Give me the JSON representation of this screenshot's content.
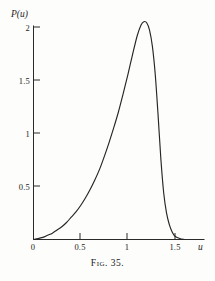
{
  "figure": {
    "caption_prefix": "Fig.",
    "caption_number": "35.",
    "caption_full": "Fig. 35."
  },
  "chart_data": {
    "type": "line",
    "title": "",
    "subtitle": "",
    "xlabel": "u",
    "ylabel": "P(u)",
    "xlim": [
      0,
      1.62
    ],
    "ylim": [
      0,
      2.18
    ],
    "xticks": [
      0,
      0.5,
      1,
      1.5
    ],
    "xticklabels": [
      "0",
      "0.5",
      "1",
      "1.5"
    ],
    "yticks": [
      0,
      0.5,
      1,
      1.5,
      2
    ],
    "yticklabels": [
      "0",
      "0.5",
      "1",
      "1.5",
      "2"
    ],
    "grid": false,
    "legend": null,
    "annotations": [],
    "series": [
      {
        "name": "P(u)",
        "color": "#262626",
        "x": [
          0.0,
          0.05,
          0.1,
          0.15,
          0.2,
          0.25,
          0.3,
          0.35,
          0.4,
          0.45,
          0.5,
          0.55,
          0.6,
          0.65,
          0.7,
          0.75,
          0.8,
          0.85,
          0.9,
          0.95,
          1.0,
          1.05,
          1.1,
          1.14,
          1.17,
          1.2,
          1.23,
          1.26,
          1.29,
          1.32,
          1.35,
          1.38,
          1.41,
          1.44,
          1.47,
          1.5,
          1.55,
          1.6
        ],
        "y": [
          0.0,
          0.01,
          0.02,
          0.04,
          0.06,
          0.09,
          0.12,
          0.16,
          0.21,
          0.26,
          0.32,
          0.39,
          0.47,
          0.56,
          0.66,
          0.78,
          0.91,
          1.05,
          1.2,
          1.37,
          1.55,
          1.74,
          1.92,
          2.02,
          2.05,
          2.04,
          1.97,
          1.82,
          1.56,
          1.18,
          0.76,
          0.44,
          0.25,
          0.14,
          0.07,
          0.03,
          0.01,
          0.0
        ]
      }
    ],
    "peak": {
      "x": 1.17,
      "y": 2.05
    }
  }
}
